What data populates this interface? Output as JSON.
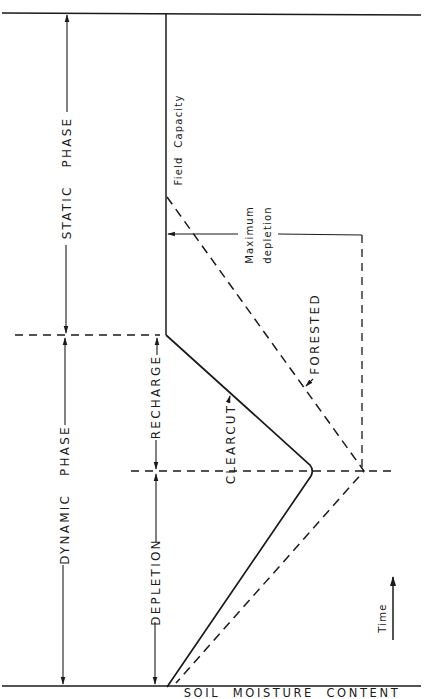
{
  "diagram": {
    "x_axis_label": "SOIL  MOISTURE  CONTENT",
    "time_label": "Time",
    "field_capacity_label": "Field  Capacity",
    "max_depletion_label_line1": "Maximum",
    "max_depletion_label_line2": "depletion",
    "phases": {
      "static": "STATIC   PHASE",
      "dynamic": "DYNAMIC   PHASE"
    },
    "subphases": {
      "recharge": "RECHARGE",
      "depletion": "DEPLETION"
    },
    "curves": {
      "clearcut": {
        "label": "CLEARCUT",
        "style": "solid"
      },
      "forested": {
        "label": "FORESTED",
        "style": "dashed"
      }
    },
    "colors": {
      "ink": "#1a1a1a",
      "background": "#ffffff"
    }
  }
}
